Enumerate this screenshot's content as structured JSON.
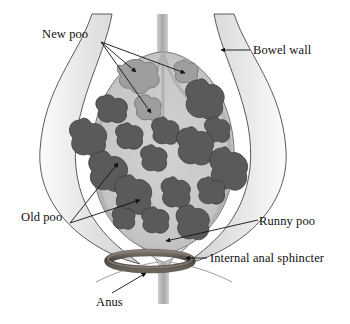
{
  "diagram": {
    "type": "anatomical-illustration",
    "background_color": "#ffffff",
    "colors": {
      "outline": "#4a4a4a",
      "bowel_wall_fill": "#e8e8e8",
      "bowel_wall_shadow": "#c4c4c4",
      "lumen_fill": "#c9c9c9",
      "old_poo": "#5a5a5a",
      "old_poo_outline": "#3c3c3c",
      "new_poo": "#9e9e9e",
      "new_poo_outline": "#6e6e6e",
      "sphincter": "#4f4a45",
      "stem": "#b4b4b4",
      "leader_line": "#1a1a1a",
      "text": "#101010"
    },
    "labels": {
      "new_poo": "New poo",
      "bowel_wall": "Bowel wall",
      "old_poo": "Old poo",
      "runny_poo": "Runny poo",
      "internal_anal_sphincter": "Internal anal sphincter",
      "anus": "Anus"
    },
    "annotations": [
      {
        "label": "New poo",
        "arrow_count": 3,
        "arrow_direction": "right-down",
        "points_to": "light grey stool masses at top of rectum"
      },
      {
        "label": "Bowel wall",
        "arrow_count": 1,
        "arrow_direction": "left",
        "points_to": "upper right bowel wall"
      },
      {
        "label": "Old poo",
        "arrow_count": 2,
        "arrow_direction": "right-up",
        "points_to": "dark grey impacted stool masses"
      },
      {
        "label": "Runny poo",
        "arrow_count": 1,
        "arrow_direction": "left-down",
        "points_to": "narrow outflow channel above sphincter"
      },
      {
        "label": "Internal anal sphincter",
        "arrow_count": 1,
        "arrow_direction": "left",
        "points_to": "dark ring at anal canal"
      },
      {
        "label": "Anus",
        "arrow_count": 1,
        "arrow_direction": "right-up",
        "points_to": "anal opening below sphincter"
      }
    ]
  }
}
